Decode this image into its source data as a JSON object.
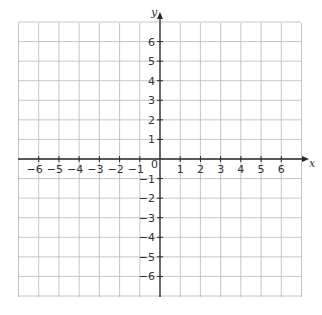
{
  "chart_data": {
    "type": "scatter",
    "title": "",
    "xlabel": "x",
    "ylabel": "y",
    "xlim": [
      -7,
      7
    ],
    "ylim": [
      -7,
      7
    ],
    "grid": true,
    "x_ticks": [
      -6,
      -5,
      -4,
      -3,
      -2,
      -1,
      1,
      2,
      3,
      4,
      5,
      6
    ],
    "x_tick_labels": [
      "−6",
      "−5",
      "−4",
      "−3",
      "−2",
      "−1",
      "1",
      "2",
      "3",
      "4",
      "5",
      "6"
    ],
    "y_ticks": [
      6,
      5,
      4,
      3,
      2,
      1,
      -1,
      -2,
      -3,
      -4,
      -5,
      -6
    ],
    "y_tick_labels": [
      "6",
      "5",
      "4",
      "3",
      "2",
      "1",
      "−1",
      "−2",
      "−3",
      "−4",
      "−5",
      "−6"
    ],
    "origin_label": "0",
    "series": [],
    "legend": null
  },
  "colors": {
    "grid": "#b8b8b8",
    "axis": "#2a2a2a",
    "text": "#333333",
    "background": "#ffffff"
  }
}
